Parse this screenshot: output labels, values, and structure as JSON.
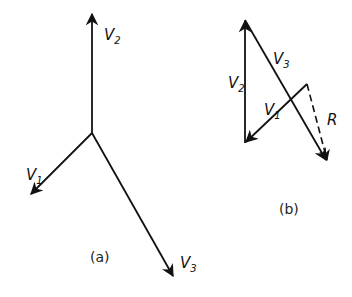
{
  "figure": {
    "diagram_a": {
      "caption": "(a)",
      "vectors": [
        {
          "name": "V2",
          "base": "V",
          "sub": "2",
          "from": [
            92,
            133
          ],
          "to": [
            92,
            13
          ],
          "label_pos": [
            104,
            40
          ]
        },
        {
          "name": "V1",
          "base": "V",
          "sub": "1",
          "from": [
            92,
            133
          ],
          "to": [
            30,
            195
          ],
          "label_pos": [
            26,
            180
          ]
        },
        {
          "name": "V3",
          "base": "V",
          "sub": "3",
          "from": [
            92,
            133
          ],
          "to": [
            174,
            277
          ],
          "label_pos": [
            180,
            268
          ]
        }
      ],
      "caption_pos": [
        90,
        262
      ]
    },
    "diagram_b": {
      "caption": "(b)",
      "vectors": [
        {
          "name": "V2",
          "base": "V",
          "sub": "2",
          "from": [
            245,
            143
          ],
          "to": [
            245,
            20
          ],
          "label_pos": [
            228,
            88
          ]
        },
        {
          "name": "V3",
          "base": "V",
          "sub": "3",
          "from": [
            245,
            20
          ],
          "to": [
            327,
            161
          ],
          "label_pos": [
            273,
            64
          ]
        },
        {
          "name": "V1",
          "base": "V",
          "sub": "1",
          "from": [
            307,
            84
          ],
          "to": [
            245,
            143
          ],
          "label_pos": [
            264,
            115
          ]
        },
        {
          "name": "R",
          "base": "R",
          "sub": "",
          "from": [
            307,
            84
          ],
          "to": [
            327,
            161
          ],
          "dashed": true,
          "label_pos": [
            327,
            125
          ]
        }
      ],
      "caption_pos": [
        279,
        214
      ]
    },
    "line_color": "#111111"
  }
}
